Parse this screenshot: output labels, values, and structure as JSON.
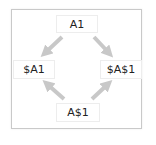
{
  "diagram": {
    "type": "cycle",
    "nodes": [
      {
        "id": "top",
        "label": "A1"
      },
      {
        "id": "left",
        "label": "$A1"
      },
      {
        "id": "right",
        "label": "$A$1"
      },
      {
        "id": "bottom",
        "label": "A$1"
      }
    ],
    "edges": [
      {
        "from": "top",
        "to": "left"
      },
      {
        "from": "top",
        "to": "right"
      },
      {
        "from": "bottom",
        "to": "left"
      },
      {
        "from": "bottom",
        "to": "right"
      }
    ],
    "colors": {
      "arrow": "#c8c8c8",
      "frame_border": "#c9c9c9",
      "node_border": "#ededed",
      "text": "#222222"
    }
  }
}
